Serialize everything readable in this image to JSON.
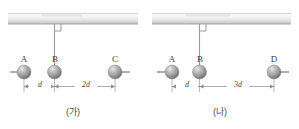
{
  "figure": {
    "colors": {
      "sphere": "#9a9a9a",
      "sphere_highlight": "#d8d8d8",
      "sphere_shadow": "#6f6f6f",
      "line": "#8c8c8c",
      "ceiling_light": "#f2f2f2",
      "ceiling_dark": "#c9c9c9",
      "text": "#3d3d3d",
      "caption": "#4a4a4a"
    },
    "panels": [
      {
        "id": "panel-ga",
        "caption": "(가)",
        "spheres": [
          {
            "label": "A",
            "cx": 24,
            "cy": 72,
            "r": 7,
            "rod": "left"
          },
          {
            "label": "B",
            "cx": 54,
            "cy": 72,
            "r": 7,
            "rod": "none"
          },
          {
            "label": "C",
            "cx": 115,
            "cy": 72,
            "r": 7,
            "rod": "right"
          }
        ],
        "string": {
          "x": 54,
          "y_top": 24,
          "y_bottom": 72
        },
        "right_angle_marker": true,
        "ceiling": {
          "x": 8,
          "y": 13,
          "w": 130,
          "h": 11
        },
        "dimensions": [
          {
            "label": "d",
            "from": 24,
            "to": 54,
            "y": 86
          },
          {
            "label": "2d",
            "from": 54,
            "to": 115,
            "y": 86
          }
        ]
      },
      {
        "id": "panel-na",
        "caption": "(나)",
        "spheres": [
          {
            "label": "A",
            "cx": 172,
            "cy": 72,
            "r": 7,
            "rod": "left"
          },
          {
            "label": "B",
            "cx": 199,
            "cy": 72,
            "r": 7,
            "rod": "none"
          },
          {
            "label": "D",
            "cx": 274,
            "cy": 72,
            "r": 7,
            "rod": "right"
          }
        ],
        "string": {
          "x": 199,
          "y_top": 24,
          "y_bottom": 72
        },
        "right_angle_marker": true,
        "ceiling": {
          "x": 152,
          "y": 13,
          "w": 139,
          "h": 11
        },
        "dimensions": [
          {
            "label": "d",
            "from": 172,
            "to": 199,
            "y": 86
          },
          {
            "label": "3d",
            "from": 199,
            "to": 274,
            "y": 86
          }
        ]
      }
    ]
  }
}
